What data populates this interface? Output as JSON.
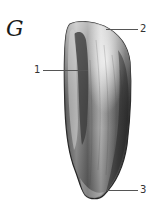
{
  "figure": {
    "letter": "G"
  },
  "labels": [
    {
      "number": "1",
      "target": "inner-ridge"
    },
    {
      "number": "2",
      "target": "top-edge"
    },
    {
      "number": "3",
      "target": "bottom-tip"
    }
  ],
  "colors": {
    "background": "#ffffff",
    "outline": "#2a2a2a",
    "shade_dark": "#3a3a3a",
    "shade_mid": "#7a7a7a",
    "shade_light": "#d8d8d8",
    "leader_line": "#555555",
    "text": "#333333"
  }
}
